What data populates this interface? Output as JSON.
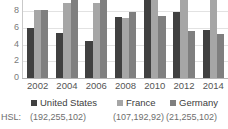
{
  "chart_data": {
    "type": "bar",
    "title": "",
    "subtitle": "",
    "xlabel": "",
    "ylabel": "",
    "categories": [
      "2002",
      "2004",
      "2006",
      "2008",
      "2010",
      "2012",
      "2014"
    ],
    "series": [
      {
        "name": "United States",
        "color": "#404040",
        "values": [
          6.0,
          5.4,
          4.4,
          7.3,
          9.3,
          7.9,
          5.7
        ]
      },
      {
        "name": "France",
        "color": "#a6a6a6",
        "values": [
          8.1,
          8.9,
          9.0,
          7.2,
          9.3,
          9.9,
          9.9
        ]
      },
      {
        "name": "Germany",
        "color": "#7f7f7f",
        "values": [
          8.1,
          9.7,
          9.7,
          7.9,
          7.4,
          5.6,
          5.2
        ]
      }
    ],
    "ylim": [
      0,
      9.3
    ],
    "ytick_labels": [
      "0",
      "2",
      "4",
      "6",
      "8"
    ],
    "ytick_values": [
      0,
      2,
      4,
      6,
      8
    ],
    "grid": true,
    "legend_position": "bottom",
    "clipped_top": true
  },
  "hsl_row": {
    "label": "HSL:",
    "values": [
      "(192,255,102)",
      "(107,192,92)",
      "(21,255,102)"
    ]
  }
}
